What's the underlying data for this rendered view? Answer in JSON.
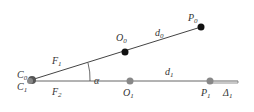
{
  "diagram": {
    "points": [
      {
        "id": "C0",
        "label": "C",
        "sub": "0",
        "x": 31,
        "y": 80,
        "color": "#444444"
      },
      {
        "id": "C1",
        "label": "C",
        "sub": "1",
        "x": 31,
        "y": 80,
        "color": "#777777"
      },
      {
        "id": "O0",
        "label": "O",
        "sub": "0",
        "x": 125,
        "y": 52,
        "color": "#111111"
      },
      {
        "id": "P0",
        "label": "P",
        "sub": "0",
        "x": 201,
        "y": 27,
        "color": "#111111"
      },
      {
        "id": "O1",
        "label": "O",
        "sub": "1",
        "x": 130,
        "y": 81,
        "color": "#888888"
      },
      {
        "id": "P1",
        "label": "P",
        "sub": "1",
        "x": 210,
        "y": 81,
        "color": "#888888"
      }
    ],
    "segments": [
      {
        "id": "F1",
        "label": "F",
        "sub": "1"
      },
      {
        "id": "d0",
        "label": "d",
        "sub": "0"
      },
      {
        "id": "F2",
        "label": "F",
        "sub": "2"
      },
      {
        "id": "d1",
        "label": "d",
        "sub": "1"
      },
      {
        "id": "Delta1",
        "label": "Δ",
        "sub": "1"
      }
    ],
    "angle": {
      "label": "α"
    }
  }
}
